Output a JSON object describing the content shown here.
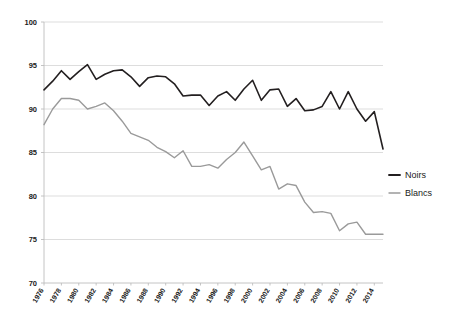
{
  "chart_data": {
    "type": "line",
    "title": "",
    "subtitle": "",
    "xlabel": "",
    "ylabel": "",
    "ylim": [
      70,
      100
    ],
    "xlim": [
      1976,
      2015
    ],
    "grid": true,
    "y_ticks": [
      70,
      75,
      80,
      85,
      90,
      95,
      100
    ],
    "legend_position": "right",
    "x": [
      1976,
      1977,
      1978,
      1979,
      1980,
      1981,
      1982,
      1983,
      1984,
      1985,
      1986,
      1987,
      1988,
      1989,
      1990,
      1991,
      1992,
      1993,
      1994,
      1995,
      1996,
      1997,
      1998,
      1999,
      2000,
      2001,
      2002,
      2003,
      2004,
      2005,
      2006,
      2007,
      2008,
      2009,
      2010,
      2011,
      2012,
      2013,
      2014,
      2015
    ],
    "x_tick_labels": [
      "1976",
      "1978",
      "1980",
      "1982",
      "1984",
      "1986",
      "1988",
      "1990",
      "1992",
      "1994",
      "1996",
      "1998",
      "2000",
      "2002",
      "2004",
      "2006",
      "2008",
      "2010",
      "2012",
      "2014"
    ],
    "series": [
      {
        "name": "Noirs",
        "color": "#231f20",
        "width": 1.6,
        "values": [
          92.2,
          93.2,
          94.4,
          93.4,
          94.3,
          95.1,
          93.4,
          94.0,
          94.4,
          94.5,
          93.7,
          92.6,
          93.6,
          93.8,
          93.7,
          92.9,
          91.5,
          91.6,
          91.6,
          90.4,
          91.5,
          92.0,
          91.0,
          92.3,
          93.3,
          91.0,
          92.2,
          92.3,
          90.3,
          91.2,
          89.8,
          89.9,
          90.3,
          92.0,
          90.0,
          92.0,
          90.0,
          88.6,
          89.7,
          85.4
        ]
      },
      {
        "name": "Blancs",
        "color": "#9a9a9a",
        "width": 1.4,
        "values": [
          88.2,
          90.0,
          91.2,
          91.2,
          91.0,
          90.0,
          90.3,
          90.7,
          89.8,
          88.6,
          87.2,
          86.8,
          86.4,
          85.6,
          85.1,
          84.4,
          85.2,
          83.4,
          83.4,
          83.6,
          83.2,
          84.2,
          85.0,
          86.2,
          84.6,
          83.0,
          83.4,
          80.8,
          81.4,
          81.2,
          79.3,
          78.1,
          78.2,
          78.0,
          76.0,
          76.8,
          77.0,
          75.6,
          75.6,
          75.6
        ]
      }
    ]
  },
  "legend": {
    "items": [
      {
        "label": "Noirs",
        "color": "#231f20"
      },
      {
        "label": "Blancs",
        "color": "#9a9a9a"
      }
    ]
  }
}
